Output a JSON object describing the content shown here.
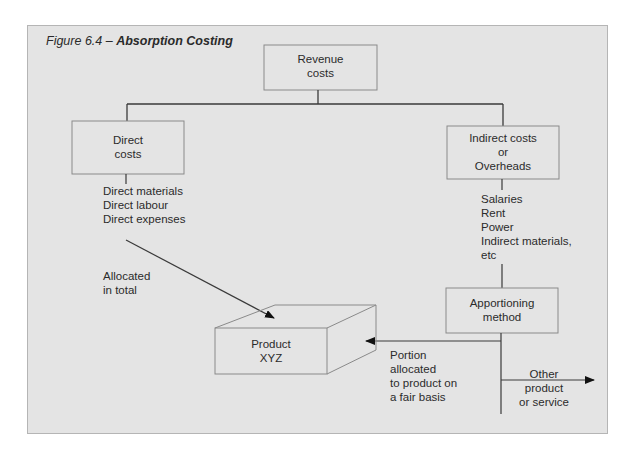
{
  "figure": {
    "number": "Figure 6.4 – ",
    "title": "Absorption Costing"
  },
  "nodes": {
    "revenue": {
      "line1": "Revenue",
      "line2": "costs"
    },
    "direct": {
      "line1": "Direct",
      "line2": "costs"
    },
    "indirect": {
      "line1": "Indirect costs",
      "line2": "or",
      "line3": "Overheads"
    },
    "apportioning": {
      "line1": "Apportioning",
      "line2": "method"
    },
    "product": {
      "line1": "Product",
      "line2": "XYZ"
    }
  },
  "lists": {
    "direct_items": [
      "Direct materials",
      "Direct labour",
      "Direct expenses"
    ],
    "indirect_items": [
      "Salaries",
      "Rent",
      "Power",
      "Indirect materials,",
      "etc"
    ]
  },
  "labels": {
    "allocated": {
      "line1": "Allocated",
      "line2": "in total"
    },
    "portion": {
      "line1": "Portion",
      "line2": "allocated",
      "line3": "to product on",
      "line4": "a fair basis"
    },
    "other": {
      "line1": "Other",
      "line2": "product",
      "line3": "or service"
    }
  },
  "colors": {
    "panel_bg": "#e4e4e4",
    "line": "#3a3a3a",
    "box_border": "#8a8a8a"
  }
}
